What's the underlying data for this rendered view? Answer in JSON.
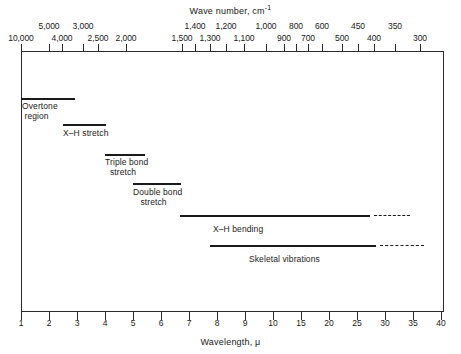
{
  "chart_data": {
    "type": "table",
    "top_axis": {
      "label": "Wave number, cm",
      "label_superscript": "-1",
      "unit": "cm^-1",
      "scale": "reciprocal of wavelength (10000/lambda)",
      "range": [
        10000,
        250
      ],
      "ticks": [
        {
          "value": "10,000",
          "x": 21,
          "row": "bot"
        },
        {
          "value": "5,000",
          "x": 49,
          "row": "top"
        },
        {
          "value": "4,000",
          "x": 62,
          "row": "bot"
        },
        {
          "value": "3,000",
          "x": 83,
          "row": "top"
        },
        {
          "value": "2,500",
          "x": 98,
          "row": "bot"
        },
        {
          "value": "2,000",
          "x": 126,
          "row": "bot"
        },
        {
          "value": "1,500",
          "x": 182,
          "row": "bot"
        },
        {
          "value": "1,400",
          "x": 195,
          "row": "top"
        },
        {
          "value": "1,300",
          "x": 210,
          "row": "bot"
        },
        {
          "value": "1,200",
          "x": 226,
          "row": "top"
        },
        {
          "value": "1,100",
          "x": 244,
          "row": "bot"
        },
        {
          "value": "1,000",
          "x": 266,
          "row": "top"
        },
        {
          "value": "900",
          "x": 284,
          "row": "bot"
        },
        {
          "value": "800",
          "x": 296,
          "row": "top"
        },
        {
          "value": "700",
          "x": 308,
          "row": "bot"
        },
        {
          "value": "600",
          "x": 322,
          "row": "top"
        },
        {
          "value": "500",
          "x": 342,
          "row": "bot"
        },
        {
          "value": "450",
          "x": 358,
          "row": "top"
        },
        {
          "value": "400",
          "x": 374,
          "row": "bot"
        },
        {
          "value": "350",
          "x": 395,
          "row": "top"
        },
        {
          "value": "300",
          "x": 420,
          "row": "bot"
        }
      ]
    },
    "bottom_axis": {
      "label": "Wavelength, ",
      "label_symbol": "μ",
      "unit": "micrometers",
      "range": [
        1,
        40
      ],
      "tick_values": [
        "1",
        "2",
        "3",
        "4",
        "5",
        "6",
        "7",
        "8",
        "9",
        "10",
        "15",
        "20",
        "25",
        "30",
        "35",
        "40"
      ],
      "tick_positions": [
        21,
        49,
        77,
        105,
        133,
        161,
        189,
        217,
        245,
        273,
        301,
        329,
        357,
        385,
        413,
        441
      ]
    },
    "bands": [
      {
        "name": "Overtone region",
        "label_lines": [
          "Overtone",
          " region"
        ],
        "label_x": 22,
        "label_y": 101,
        "solid": {
          "x": 21,
          "width": 54,
          "y": 98
        },
        "dashed": null
      },
      {
        "name": "X-H stretch",
        "label_lines": [
          "X–H stretch"
        ],
        "label_x": 63,
        "label_y": 128,
        "solid": {
          "x": 63,
          "width": 43,
          "y": 124
        },
        "dashed": null
      },
      {
        "name": "Triple bond stretch",
        "label_lines": [
          "Triple bond",
          "  stretch"
        ],
        "label_x": 105,
        "label_y": 157,
        "solid": {
          "x": 105,
          "width": 40,
          "y": 154
        },
        "dashed": null
      },
      {
        "name": "Double bond stretch",
        "label_lines": [
          "Double bond",
          "   stretch"
        ],
        "label_x": 133,
        "label_y": 187,
        "solid": {
          "x": 133,
          "width": 48,
          "y": 183
        },
        "dashed": null
      },
      {
        "name": "X-H bending",
        "label_lines": [
          "X–H bending"
        ],
        "label_x": 213,
        "label_y": 224,
        "solid": {
          "x": 180,
          "width": 190,
          "y": 215
        },
        "dashed": {
          "x": 374,
          "width": 36,
          "y": 215
        }
      },
      {
        "name": "Skeletal vibrations",
        "label_lines": [
          "Skeletal vibrations"
        ],
        "label_x": 249,
        "label_y": 254,
        "solid": {
          "x": 210,
          "width": 166,
          "y": 245
        },
        "dashed": {
          "x": 380,
          "width": 44,
          "y": 245
        }
      }
    ],
    "grid": false,
    "legend": null,
    "colors": {
      "ink": "#1a1a1a",
      "frame": "#2b2b2b",
      "background": "#ffffff"
    }
  }
}
